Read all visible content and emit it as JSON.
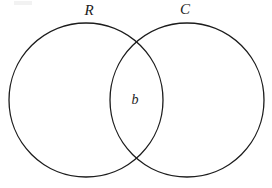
{
  "figure": {
    "type": "venn-diagram",
    "title": "",
    "background_color": "#ffffff",
    "stroke_color": "#1c1c1c",
    "stroke_width": 1.3,
    "width": 272,
    "height": 188
  },
  "sets": [
    {
      "id": "left",
      "label": "R",
      "label_x": 89,
      "label_y": 15,
      "center_x": 86,
      "center_y": 100,
      "radius": 77
    },
    {
      "id": "right",
      "label": "C",
      "label_x": 185,
      "label_y": 14,
      "center_x": 187,
      "center_y": 100,
      "radius": 77
    }
  ],
  "regions": [
    {
      "id": "intersection",
      "label": "b",
      "label_x": 135,
      "label_y": 101
    }
  ]
}
